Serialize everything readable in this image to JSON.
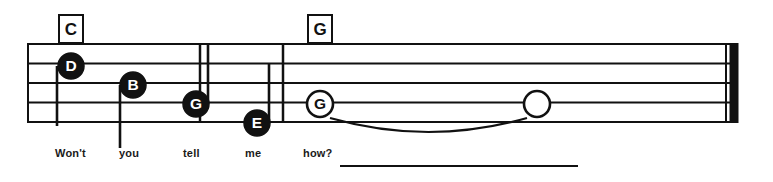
{
  "document": {
    "type": "music-notation-staff",
    "title": "Lead sheet excerpt — Won't you tell me how?",
    "background_color": "#ffffff",
    "ink_color": "#111111"
  },
  "staff": {
    "line_count": 5,
    "top_y": 44,
    "bottom_y": 122,
    "line_spacing": 19.5,
    "left_x": 28,
    "right_x": 738,
    "stroke_width": 2,
    "opening_barline_x": 28,
    "barlines_x": [
      200,
      283
    ],
    "final_barline": {
      "type": "thin-thick",
      "thin_x": 726,
      "thick_x": 734,
      "thin_width": 2,
      "thick_width": 9
    }
  },
  "chord_symbols": [
    {
      "label": "C",
      "x": 58,
      "y": 14,
      "width": 22,
      "height": 26,
      "font_size": 17
    },
    {
      "label": "G",
      "x": 307,
      "y": 14,
      "width": 22,
      "height": 26,
      "font_size": 17
    }
  ],
  "notes": [
    {
      "letter": "D",
      "head_style": "filled",
      "cx": 71,
      "cy": 66,
      "r": 13,
      "letter_color": "#ffffff",
      "head_color": "#111111",
      "stem": {
        "direction": "down",
        "x": 57,
        "from_y": 66,
        "to_y": 126
      }
    },
    {
      "letter": "B",
      "head_style": "filled",
      "cx": 133,
      "cy": 85,
      "r": 13,
      "letter_color": "#ffffff",
      "head_color": "#111111",
      "stem": {
        "direction": "down",
        "x": 120,
        "from_y": 85,
        "to_y": 148
      }
    },
    {
      "letter": "G",
      "head_style": "filled",
      "cx": 196,
      "cy": 104,
      "r": 13,
      "letter_color": "#ffffff",
      "head_color": "#111111",
      "stem": {
        "direction": "up",
        "x": 208,
        "from_y": 104,
        "to_y": 44
      }
    },
    {
      "letter": "E",
      "head_style": "filled",
      "cx": 257,
      "cy": 123,
      "r": 13,
      "letter_color": "#ffffff",
      "head_color": "#111111",
      "stem": {
        "direction": "up",
        "x": 269,
        "from_y": 123,
        "to_y": 63
      }
    },
    {
      "letter": "G",
      "head_style": "open-lettered",
      "cx": 320,
      "cy": 104,
      "r": 13,
      "letter_color": "#111111",
      "head_color": "#ffffff",
      "stem": null
    },
    {
      "letter": "",
      "head_style": "open-plain",
      "cx": 537,
      "cy": 104,
      "r": 13,
      "letter_color": "#111111",
      "head_color": "#ffffff",
      "stem": null
    }
  ],
  "tie": {
    "from_x": 330,
    "to_x": 527,
    "baseline_y": 118,
    "sag_y": 140,
    "direction": "below"
  },
  "lyrics": {
    "baseline_y": 158,
    "font_size": 11,
    "syllables": [
      {
        "text": "Won't",
        "x": 55
      },
      {
        "text": "you",
        "x": 119
      },
      {
        "text": "tell",
        "x": 183
      },
      {
        "text": "me",
        "x": 245
      },
      {
        "text": "how?",
        "x": 303
      }
    ],
    "extension_line": {
      "from_x": 340,
      "to_x": 578,
      "y": 166
    }
  }
}
